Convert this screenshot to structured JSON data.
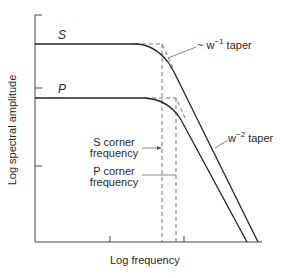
{
  "diagram": {
    "x_axis_label": "Log frequency",
    "y_axis_label": "Log spectral amplitude",
    "curves": [
      {
        "name": "S",
        "label": "S",
        "plateau_y": 44,
        "corner_x": 162
      },
      {
        "name": "P",
        "label": "P",
        "plateau_y": 98,
        "corner_x": 176
      }
    ],
    "annotations": {
      "taper1_prefix": "~ w",
      "taper1_exp": "−1",
      "taper1_suffix": " taper",
      "taper2_prefix": "w",
      "taper2_exp": "−2",
      "taper2_suffix": " taper",
      "s_corner_line1": "S corner",
      "s_corner_line2": "frequency",
      "p_corner_line1": "P corner",
      "p_corner_line2": "frequency"
    },
    "colors": {
      "line": "#2a2a2a",
      "dashed": "#555555",
      "background": "#ffffff"
    }
  }
}
